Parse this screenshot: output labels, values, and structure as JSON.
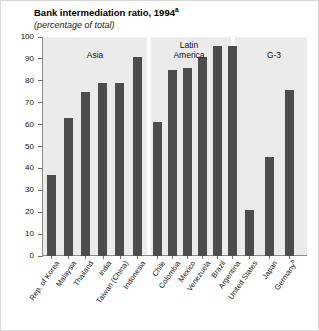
{
  "chart_data": {
    "type": "bar",
    "title": "Bank intermediation ratio, 1994",
    "title_superscript": "a",
    "subtitle": "(percentage of total)",
    "xlabel": "",
    "ylabel": "",
    "ylim": [
      0,
      100
    ],
    "yticks": [
      100,
      90,
      80,
      70,
      60,
      50,
      40,
      30,
      20,
      10,
      0
    ],
    "grid": false,
    "legend": "none",
    "bar_color": "#4d4d4d",
    "plot_background": "#ebebeb",
    "categories": [
      "Rep. of Korea",
      "Malaysia",
      "Thailand",
      "India",
      "Taiwan (China)",
      "Indonesia",
      "Chile",
      "Colombia",
      "Mexico",
      "Venezuela",
      "Brazil",
      "Argentina",
      "United States",
      "Japan",
      "Germany"
    ],
    "values": [
      37,
      63,
      75,
      79,
      79,
      91,
      61,
      85,
      86,
      91,
      96,
      96,
      21,
      45,
      76
    ],
    "groups": [
      {
        "label": "Asia",
        "categories": [
          "Rep. of Korea",
          "Malaysia",
          "Thailand",
          "India",
          "Taiwan (China)",
          "Indonesia"
        ],
        "values": [
          37,
          63,
          75,
          79,
          79,
          91
        ]
      },
      {
        "label": "Latin\nAmerica",
        "categories": [
          "Chile",
          "Colombia",
          "Mexico",
          "Venezuela",
          "Brazil",
          "Argentina"
        ],
        "values": [
          61,
          85,
          86,
          91,
          96,
          96
        ]
      },
      {
        "label": "G-3",
        "categories": [
          "United States",
          "Japan",
          "Germany"
        ],
        "values": [
          21,
          45,
          76
        ]
      }
    ],
    "category_superscripts": {
      "Germany": "b"
    }
  },
  "axis": {
    "y_labels": [
      "100",
      "90",
      "80",
      "70",
      "60",
      "50",
      "40",
      "30",
      "20",
      "10",
      "0"
    ]
  },
  "categories_display": [
    {
      "label": "Rep. of Korea",
      "sup": ""
    },
    {
      "label": "Malaysia",
      "sup": ""
    },
    {
      "label": "Thailand",
      "sup": ""
    },
    {
      "label": "India",
      "sup": ""
    },
    {
      "label": "Taiwan (China)",
      "sup": ""
    },
    {
      "label": "Indonesia",
      "sup": ""
    },
    {
      "label": "Chile",
      "sup": ""
    },
    {
      "label": "Colombia",
      "sup": ""
    },
    {
      "label": "Mexico",
      "sup": ""
    },
    {
      "label": "Venezuela",
      "sup": ""
    },
    {
      "label": "Brazil",
      "sup": ""
    },
    {
      "label": "Argentina",
      "sup": ""
    },
    {
      "label": "United States",
      "sup": ""
    },
    {
      "label": "Japan",
      "sup": ""
    },
    {
      "label": "Germany",
      "sup": "b"
    }
  ]
}
